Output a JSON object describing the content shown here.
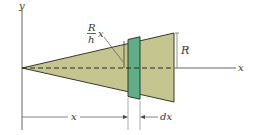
{
  "diagram": {
    "type": "cone-volume-element",
    "colors": {
      "cone_fill": "#c5c590",
      "cone_outline": "#3a3a2a",
      "strip_fill": "#5fae88",
      "strip_outline": "#2a3a2a",
      "axis": "#555555",
      "dimension": "#555555"
    },
    "labels": {
      "y_axis": "y",
      "x_axis": "x",
      "radius": "R",
      "radius_fraction_num": "R",
      "radius_fraction_den": "h",
      "radius_fraction_var": "x",
      "dim_x": "x",
      "dim_dx": "dx"
    }
  }
}
